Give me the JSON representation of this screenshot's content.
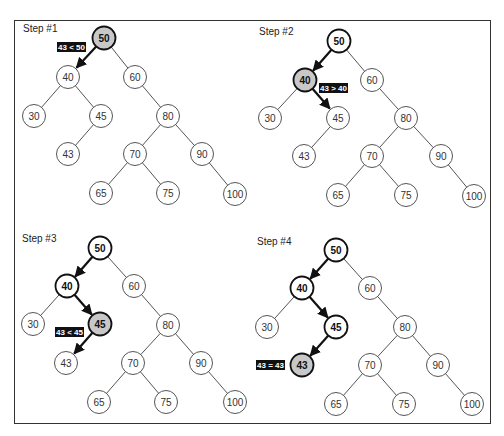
{
  "diagram": {
    "title_fragment_visible": false,
    "colors": {
      "edge": "#555555",
      "node_border": "#555555",
      "visited_border": "#111111",
      "current_fill": "#c8c8c8",
      "arrow": "#111111",
      "label_bg": "#111111",
      "label_text": "#ffffff",
      "frame": "#333333"
    },
    "steps": [
      {
        "label": "Step #1",
        "label_pos": [
          23,
          32
        ],
        "nodes": [
          {
            "v": "50",
            "x": 104,
            "y": 38,
            "state": "current"
          },
          {
            "v": "40",
            "x": 68,
            "y": 77,
            "state": "normal"
          },
          {
            "v": "60",
            "x": 135,
            "y": 77,
            "state": "normal"
          },
          {
            "v": "30",
            "x": 34,
            "y": 116,
            "state": "normal"
          },
          {
            "v": "45",
            "x": 101,
            "y": 116,
            "state": "normal"
          },
          {
            "v": "80",
            "x": 168,
            "y": 116,
            "state": "normal"
          },
          {
            "v": "43",
            "x": 68,
            "y": 154,
            "state": "normal"
          },
          {
            "v": "70",
            "x": 135,
            "y": 154,
            "state": "normal"
          },
          {
            "v": "90",
            "x": 202,
            "y": 154,
            "state": "normal"
          },
          {
            "v": "65",
            "x": 101,
            "y": 193,
            "state": "normal"
          },
          {
            "v": "75",
            "x": 168,
            "y": 193,
            "state": "normal"
          },
          {
            "v": "100",
            "x": 235,
            "y": 194,
            "state": "normal"
          }
        ],
        "edges": [
          [
            "50",
            "40"
          ],
          [
            "50",
            "60"
          ],
          [
            "40",
            "30"
          ],
          [
            "40",
            "45"
          ],
          [
            "45",
            "43"
          ],
          [
            "60",
            "80"
          ],
          [
            "80",
            "70"
          ],
          [
            "80",
            "90"
          ],
          [
            "70",
            "65"
          ],
          [
            "70",
            "75"
          ],
          [
            "90",
            "100"
          ]
        ],
        "arrows": [
          [
            "50",
            "40"
          ]
        ],
        "comparison": {
          "text": "43 < 50",
          "x": 57,
          "y": 42,
          "w": 29,
          "h": 10
        }
      },
      {
        "label": "Step #2",
        "label_pos": [
          259,
          35
        ],
        "nodes": [
          {
            "v": "50",
            "x": 339,
            "y": 41,
            "state": "visited"
          },
          {
            "v": "40",
            "x": 305,
            "y": 80,
            "state": "current"
          },
          {
            "v": "60",
            "x": 372,
            "y": 80,
            "state": "normal"
          },
          {
            "v": "30",
            "x": 270,
            "y": 118,
            "state": "normal"
          },
          {
            "v": "45",
            "x": 338,
            "y": 118,
            "state": "normal"
          },
          {
            "v": "80",
            "x": 406,
            "y": 118,
            "state": "normal"
          },
          {
            "v": "43",
            "x": 304,
            "y": 156,
            "state": "normal"
          },
          {
            "v": "70",
            "x": 372,
            "y": 156,
            "state": "normal"
          },
          {
            "v": "90",
            "x": 441,
            "y": 156,
            "state": "normal"
          },
          {
            "v": "65",
            "x": 338,
            "y": 195,
            "state": "normal"
          },
          {
            "v": "75",
            "x": 406,
            "y": 195,
            "state": "normal"
          },
          {
            "v": "100",
            "x": 474,
            "y": 196,
            "state": "normal"
          }
        ],
        "edges": [
          [
            "50",
            "40"
          ],
          [
            "50",
            "60"
          ],
          [
            "40",
            "30"
          ],
          [
            "40",
            "45"
          ],
          [
            "45",
            "43"
          ],
          [
            "60",
            "80"
          ],
          [
            "80",
            "70"
          ],
          [
            "80",
            "90"
          ],
          [
            "70",
            "65"
          ],
          [
            "70",
            "75"
          ],
          [
            "90",
            "100"
          ]
        ],
        "arrows": [
          [
            "50",
            "40"
          ],
          [
            "40",
            "45"
          ]
        ],
        "comparison": {
          "text": "43 > 40",
          "x": 319,
          "y": 83,
          "w": 29,
          "h": 10
        }
      },
      {
        "label": "Step #3",
        "label_pos": [
          22,
          242
        ],
        "nodes": [
          {
            "v": "50",
            "x": 100,
            "y": 248,
            "state": "visited"
          },
          {
            "v": "40",
            "x": 67,
            "y": 286,
            "state": "visited"
          },
          {
            "v": "60",
            "x": 134,
            "y": 286,
            "state": "normal"
          },
          {
            "v": "30",
            "x": 33,
            "y": 324,
            "state": "normal"
          },
          {
            "v": "45",
            "x": 100,
            "y": 324,
            "state": "current"
          },
          {
            "v": "80",
            "x": 168,
            "y": 325,
            "state": "normal"
          },
          {
            "v": "43",
            "x": 66,
            "y": 363,
            "state": "normal"
          },
          {
            "v": "70",
            "x": 133,
            "y": 363,
            "state": "normal"
          },
          {
            "v": "90",
            "x": 201,
            "y": 363,
            "state": "normal"
          },
          {
            "v": "65",
            "x": 99,
            "y": 402,
            "state": "normal"
          },
          {
            "v": "75",
            "x": 166,
            "y": 402,
            "state": "normal"
          },
          {
            "v": "100",
            "x": 235,
            "y": 402,
            "state": "normal"
          }
        ],
        "edges": [
          [
            "50",
            "40"
          ],
          [
            "50",
            "60"
          ],
          [
            "40",
            "30"
          ],
          [
            "40",
            "45"
          ],
          [
            "45",
            "43"
          ],
          [
            "60",
            "80"
          ],
          [
            "80",
            "70"
          ],
          [
            "80",
            "90"
          ],
          [
            "70",
            "65"
          ],
          [
            "70",
            "75"
          ],
          [
            "90",
            "100"
          ]
        ],
        "arrows": [
          [
            "50",
            "40"
          ],
          [
            "40",
            "45"
          ],
          [
            "45",
            "43"
          ]
        ],
        "comparison": {
          "text": "43 < 45",
          "x": 55,
          "y": 327,
          "w": 29,
          "h": 10
        }
      },
      {
        "label": "Step #4",
        "label_pos": [
          257,
          245
        ],
        "nodes": [
          {
            "v": "50",
            "x": 336,
            "y": 250,
            "state": "visited"
          },
          {
            "v": "40",
            "x": 302,
            "y": 288,
            "state": "visited"
          },
          {
            "v": "60",
            "x": 370,
            "y": 288,
            "state": "normal"
          },
          {
            "v": "30",
            "x": 267,
            "y": 327,
            "state": "normal"
          },
          {
            "v": "45",
            "x": 336,
            "y": 327,
            "state": "visited"
          },
          {
            "v": "80",
            "x": 405,
            "y": 327,
            "state": "normal"
          },
          {
            "v": "43",
            "x": 302,
            "y": 365,
            "state": "current"
          },
          {
            "v": "70",
            "x": 370,
            "y": 365,
            "state": "normal"
          },
          {
            "v": "90",
            "x": 438,
            "y": 365,
            "state": "normal"
          },
          {
            "v": "65",
            "x": 336,
            "y": 404,
            "state": "normal"
          },
          {
            "v": "75",
            "x": 404,
            "y": 404,
            "state": "normal"
          },
          {
            "v": "100",
            "x": 472,
            "y": 404,
            "state": "normal"
          }
        ],
        "edges": [
          [
            "50",
            "40"
          ],
          [
            "50",
            "60"
          ],
          [
            "40",
            "30"
          ],
          [
            "40",
            "45"
          ],
          [
            "45",
            "43"
          ],
          [
            "60",
            "80"
          ],
          [
            "80",
            "70"
          ],
          [
            "80",
            "90"
          ],
          [
            "70",
            "65"
          ],
          [
            "70",
            "75"
          ],
          [
            "90",
            "100"
          ]
        ],
        "arrows": [
          [
            "50",
            "40"
          ],
          [
            "40",
            "45"
          ],
          [
            "45",
            "43"
          ]
        ],
        "comparison": {
          "text": "43 = 43",
          "x": 256,
          "y": 360,
          "w": 29,
          "h": 10
        }
      }
    ]
  }
}
